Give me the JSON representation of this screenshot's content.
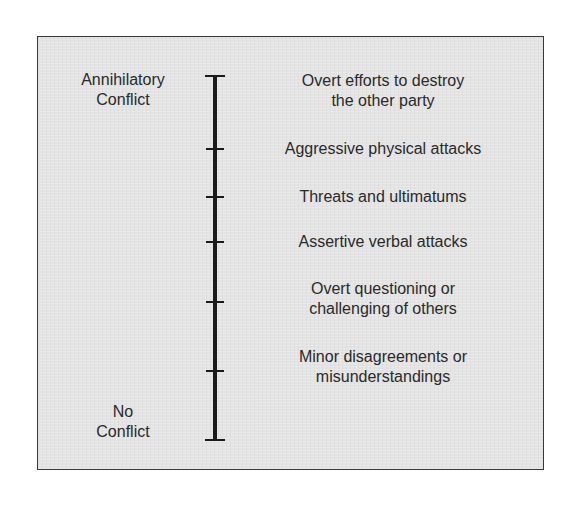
{
  "diagram": {
    "title": "",
    "axis": {
      "top_label": [
        "Annihilatory",
        "Conflict"
      ],
      "bottom_label": [
        "No",
        "Conflict"
      ]
    },
    "levels": [
      {
        "lines": [
          "Overt efforts to destroy",
          "the other party"
        ],
        "tick_y": 76
      },
      {
        "lines": [
          "Aggressive physical attacks"
        ],
        "tick_y": 149
      },
      {
        "lines": [
          "Threats and ultimatums"
        ],
        "tick_y": 197
      },
      {
        "lines": [
          "Assertive verbal attacks"
        ],
        "tick_y": 242
      },
      {
        "lines": [
          "Overt questioning or",
          "challenging of others"
        ],
        "tick_y": 302
      },
      {
        "lines": [
          "Minor disagreements or",
          "misunderstandings"
        ],
        "tick_y": 371
      },
      {
        "lines": [],
        "tick_y": 440
      }
    ],
    "colors": {
      "background": "#e4e4e4",
      "line": "#1a1a1a",
      "text": "#2a2a2a"
    }
  }
}
